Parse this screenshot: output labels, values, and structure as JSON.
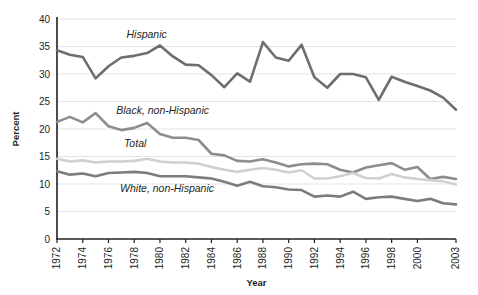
{
  "chart_data": {
    "type": "line",
    "title": "",
    "xlabel": "Year",
    "ylabel": "Percent",
    "ylim": [
      0,
      40
    ],
    "ytick_step": 5,
    "yticks": [
      "0",
      "5",
      "10",
      "15",
      "20",
      "25",
      "30",
      "35",
      "40"
    ],
    "grid": true,
    "legend_position": "inline-labels",
    "x": [
      1972,
      1973,
      1974,
      1975,
      1976,
      1977,
      1978,
      1979,
      1980,
      1981,
      1982,
      1983,
      1984,
      1985,
      1986,
      1987,
      1988,
      1989,
      1990,
      1991,
      1992,
      1993,
      1994,
      1995,
      1996,
      1997,
      1998,
      1999,
      2000,
      2001,
      2002,
      2003
    ],
    "xtick_labels": [
      "1972",
      "1974",
      "1976",
      "1978",
      "1980",
      "1982",
      "1984",
      "1986",
      "1988",
      "1990",
      "1992",
      "1994",
      "1996",
      "1998",
      "2000",
      "2003"
    ],
    "series": [
      {
        "name": "Hispanic",
        "color": "#6d6e70",
        "label_x": 1977.4,
        "label_y": 36.6,
        "values": [
          34.3,
          33.5,
          33.1,
          29.2,
          31.4,
          33.0,
          33.3,
          33.8,
          35.2,
          33.2,
          31.7,
          31.6,
          29.8,
          27.6,
          30.1,
          28.6,
          35.8,
          33.0,
          32.4,
          35.3,
          29.4,
          27.5,
          30.0,
          30.0,
          29.4,
          25.3,
          29.5,
          28.6,
          27.8,
          27.0,
          25.7,
          23.5
        ]
      },
      {
        "name": "Black, non-Hispanic",
        "color": "#8c8d8f",
        "label_x": 1976.6,
        "label_y": 22.7,
        "values": [
          21.3,
          22.2,
          21.2,
          22.9,
          20.5,
          19.8,
          20.2,
          21.1,
          19.1,
          18.4,
          18.4,
          18.0,
          15.5,
          15.2,
          14.2,
          14.1,
          14.5,
          13.9,
          13.2,
          13.6,
          13.7,
          13.6,
          12.6,
          12.1,
          13.0,
          13.4,
          13.8,
          12.6,
          13.1,
          10.9,
          11.3,
          10.9
        ]
      },
      {
        "name": "Total",
        "color": "#cfd0d1",
        "label_x": 1977.2,
        "label_y": 16.7,
        "values": [
          14.6,
          14.1,
          14.3,
          13.9,
          14.1,
          14.1,
          14.2,
          14.6,
          14.1,
          13.9,
          13.9,
          13.7,
          13.1,
          12.6,
          12.2,
          12.6,
          12.9,
          12.6,
          12.1,
          12.5,
          11.0,
          11.0,
          11.4,
          12.0,
          11.1,
          11.0,
          11.8,
          11.2,
          10.9,
          10.7,
          10.5,
          9.9
        ]
      },
      {
        "name": "White, non-Hispanic",
        "color": "#7a7c7e",
        "label_x": 1976.9,
        "label_y": 8.6,
        "values": [
          12.3,
          11.7,
          11.9,
          11.4,
          12.0,
          12.1,
          12.2,
          12.0,
          11.4,
          11.4,
          11.4,
          11.2,
          11.0,
          10.4,
          9.7,
          10.4,
          9.6,
          9.4,
          9.0,
          8.9,
          7.7,
          7.9,
          7.7,
          8.6,
          7.3,
          7.6,
          7.7,
          7.3,
          6.9,
          7.3,
          6.5,
          6.3
        ]
      }
    ]
  }
}
